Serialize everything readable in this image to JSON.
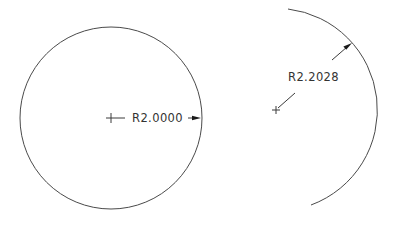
{
  "drawing": {
    "stroke_color": "#4a4a4a",
    "background": "#ffffff",
    "entities": [
      {
        "type": "circle",
        "name": "left-circle",
        "center": [
          111,
          118
        ],
        "radius": 91,
        "dimension": {
          "label": "R2.0000",
          "kind": "radius",
          "text_pos": [
            132,
            122
          ],
          "center_mark": [
            111,
            118
          ],
          "leader_start": [
            106,
            118
          ],
          "leader_end": [
            125,
            118
          ],
          "arrow_line_start": [
            188,
            118
          ],
          "arrow_tip": [
            201,
            118
          ]
        }
      },
      {
        "type": "arc",
        "name": "right-arc",
        "center": [
          276,
          110
        ],
        "radius": 101.5,
        "start_point": [
          288,
          9
        ],
        "end_point": [
          311,
          205
        ],
        "dimension": {
          "label": "R2.2028",
          "kind": "radius",
          "text_pos": [
            288,
            81
          ],
          "center_mark": [
            276,
            110
          ],
          "leader1_start": [
            295,
            93
          ],
          "leader1_end": [
            278,
            108
          ],
          "leader2_start": [
            332,
            60
          ],
          "arrow_tip": [
            352,
            43
          ]
        }
      }
    ]
  }
}
